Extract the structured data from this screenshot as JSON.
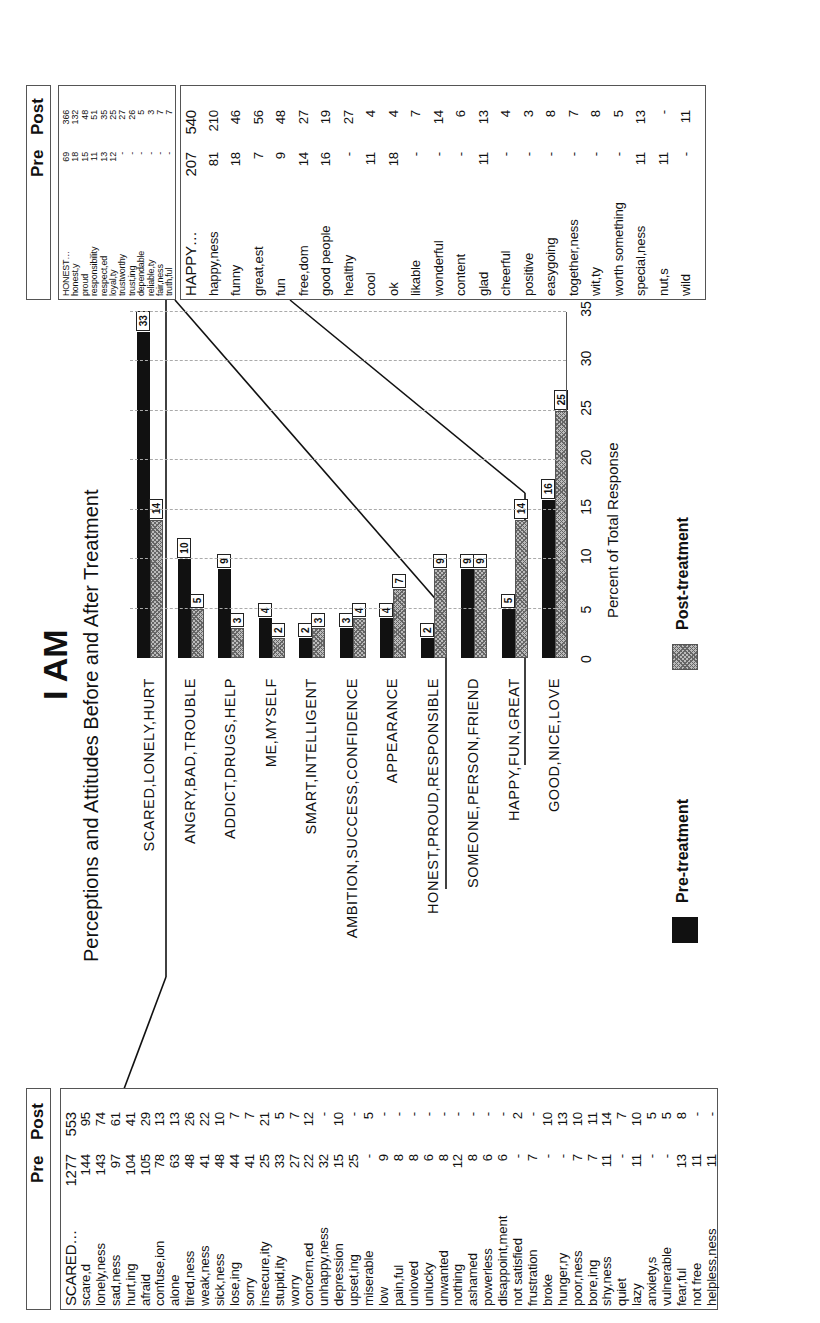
{
  "title": "I AM",
  "subtitle": "Perceptions and Attitudes Before and After Treatment",
  "chart_data": {
    "type": "bar",
    "orientation": "vertical bars on rotated page",
    "title": "I AM",
    "subtitle": "Perceptions and Attitudes Before and After Treatment",
    "xlabel": "",
    "ylabel": "Percent of Total Response",
    "ylim": [
      0,
      35
    ],
    "yticks": [
      0,
      5,
      10,
      15,
      20,
      25,
      30,
      35
    ],
    "grid": true,
    "legend_position": "bottom",
    "categories": [
      "SCARED,LONELY,HURT",
      "ANGRY,BAD,TROUBLE",
      "ADDICT,DRUGS,HELP",
      "ME,MYSELF",
      "SMART,INTELLIGENT",
      "AMBITION,SUCCESS,CONFIDENCE",
      "APPEARANCE",
      "HONEST,PROUD,RESPONSIBLE",
      "SOMEONE,PERSON,FRIEND",
      "HAPPY,FUN,GREAT",
      "GOOD,NICE,LOVE"
    ],
    "series": [
      {
        "name": "Pre-treatment",
        "color": "#111111",
        "values": [
          33,
          10,
          9,
          4,
          2,
          3,
          4,
          2,
          9,
          5,
          16
        ]
      },
      {
        "name": "Post-treatment",
        "color": "#b0b0b0",
        "pattern": "crosshatch",
        "values": [
          14,
          5,
          3,
          2,
          3,
          4,
          7,
          9,
          9,
          14,
          25
        ]
      }
    ]
  },
  "axis": {
    "title": "Percent of Total Response",
    "ticks": [
      "0",
      "5",
      "10",
      "15",
      "20",
      "25",
      "30",
      "35"
    ]
  },
  "legend": {
    "pre": "Pre-treatment",
    "post": "Post-treatment"
  },
  "tables": {
    "scared": {
      "header_pre": "Pre",
      "header_post": "Post",
      "rows": [
        {
          "word": "SCARED…",
          "pre": "1277",
          "post": "553"
        },
        {
          "word": "scare,d",
          "pre": "144",
          "post": "95"
        },
        {
          "word": "lonely,ness",
          "pre": "143",
          "post": "74"
        },
        {
          "word": "sad,ness",
          "pre": "97",
          "post": "61"
        },
        {
          "word": "hurt,ing",
          "pre": "104",
          "post": "41"
        },
        {
          "word": "afraid",
          "pre": "105",
          "post": "29"
        },
        {
          "word": "confuse,ion",
          "pre": "78",
          "post": "13"
        },
        {
          "word": "alone",
          "pre": "63",
          "post": "13"
        },
        {
          "word": "tired,ness",
          "pre": "48",
          "post": "26"
        },
        {
          "word": "weak,ness",
          "pre": "41",
          "post": "22"
        },
        {
          "word": "sick,ness",
          "pre": "48",
          "post": "10"
        },
        {
          "word": "lose,ing",
          "pre": "44",
          "post": "7"
        },
        {
          "word": "sorry",
          "pre": "41",
          "post": "7"
        },
        {
          "word": "insecure,ity",
          "pre": "25",
          "post": "21"
        },
        {
          "word": "stupid,ity",
          "pre": "33",
          "post": "5"
        },
        {
          "word": "worry",
          "pre": "27",
          "post": "7"
        },
        {
          "word": "concern,ed",
          "pre": "22",
          "post": "12"
        },
        {
          "word": "unhappy,ness",
          "pre": "32",
          "post": "-"
        },
        {
          "word": "depression",
          "pre": "15",
          "post": "10"
        },
        {
          "word": "upset,ing",
          "pre": "25",
          "post": "-"
        },
        {
          "word": "miserable",
          "pre": "-",
          "post": "5"
        },
        {
          "word": "low",
          "pre": "9",
          "post": "-"
        },
        {
          "word": "pain,ful",
          "pre": "8",
          "post": "-"
        },
        {
          "word": "unloved",
          "pre": "8",
          "post": "-"
        },
        {
          "word": "unlucky",
          "pre": "6",
          "post": "-"
        },
        {
          "word": "unwanted",
          "pre": "8",
          "post": "-"
        },
        {
          "word": "nothing",
          "pre": "12",
          "post": "-"
        },
        {
          "word": "ashamed",
          "pre": "8",
          "post": "-"
        },
        {
          "word": "powerless",
          "pre": "6",
          "post": "-"
        },
        {
          "word": "disappoint,ment",
          "pre": "6",
          "post": "-"
        },
        {
          "word": "not satisfied",
          "pre": "-",
          "post": "2"
        },
        {
          "word": "frustration",
          "pre": "7",
          "post": "-"
        },
        {
          "word": "broke",
          "pre": "-",
          "post": "10"
        },
        {
          "word": "hunger,ry",
          "pre": "-",
          "post": "13"
        },
        {
          "word": "poor,ness",
          "pre": "7",
          "post": "10"
        },
        {
          "word": "bore,ing",
          "pre": "7",
          "post": "11"
        },
        {
          "word": "shy,ness",
          "pre": "11",
          "post": "14"
        },
        {
          "word": "quiet",
          "pre": "-",
          "post": "7"
        },
        {
          "word": "lazy",
          "pre": "11",
          "post": "10"
        },
        {
          "word": "anxiety,s",
          "pre": "-",
          "post": "5"
        },
        {
          "word": "vulnerable",
          "pre": "-",
          "post": "5"
        },
        {
          "word": "fear,ful",
          "pre": "13",
          "post": "8"
        },
        {
          "word": "not free",
          "pre": "11",
          "post": "-"
        },
        {
          "word": "helpless,ness",
          "pre": "11",
          "post": "-"
        }
      ]
    },
    "honest": {
      "header_pre": "Pre",
      "header_post": "Post",
      "rows": [
        {
          "word": "HONEST…",
          "pre": "69",
          "post": "366"
        },
        {
          "word": "honest,y",
          "pre": "18",
          "post": "132"
        },
        {
          "word": "proud",
          "pre": "15",
          "post": "48"
        },
        {
          "word": "responsibility",
          "pre": "11",
          "post": "51"
        },
        {
          "word": "respect,ed",
          "pre": "13",
          "post": "35"
        },
        {
          "word": "loyal,ty",
          "pre": "12",
          "post": "25"
        },
        {
          "word": "trustworthy",
          "pre": "-",
          "post": "27"
        },
        {
          "word": "trust,ing",
          "pre": "-",
          "post": "26"
        },
        {
          "word": "dependable",
          "pre": "-",
          "post": "5"
        },
        {
          "word": "reliable,ty",
          "pre": "-",
          "post": "3"
        },
        {
          "word": "fair,ness",
          "pre": "-",
          "post": "7"
        },
        {
          "word": "truth,ful",
          "pre": "-",
          "post": "7"
        }
      ]
    },
    "happy": {
      "rows": [
        {
          "word": "HAPPY…",
          "pre": "207",
          "post": "540"
        },
        {
          "word": "happy,ness",
          "pre": "81",
          "post": "210"
        },
        {
          "word": "funny",
          "pre": "18",
          "post": "46"
        },
        {
          "word": "great,est",
          "pre": "7",
          "post": "56"
        },
        {
          "word": "fun",
          "pre": "9",
          "post": "48"
        },
        {
          "word": "free,dom",
          "pre": "14",
          "post": "27"
        },
        {
          "word": "good people",
          "pre": "16",
          "post": "19"
        },
        {
          "word": "healthy",
          "pre": "-",
          "post": "27"
        },
        {
          "word": "cool",
          "pre": "11",
          "post": "4"
        },
        {
          "word": "ok",
          "pre": "18",
          "post": "4"
        },
        {
          "word": "likable",
          "pre": "-",
          "post": "7"
        },
        {
          "word": "wonderful",
          "pre": "-",
          "post": "14"
        },
        {
          "word": "content",
          "pre": "-",
          "post": "6"
        },
        {
          "word": "glad",
          "pre": "11",
          "post": "13"
        },
        {
          "word": "cheerful",
          "pre": "-",
          "post": "4"
        },
        {
          "word": "positive",
          "pre": "-",
          "post": "3"
        },
        {
          "word": "easygoing",
          "pre": "-",
          "post": "8"
        },
        {
          "word": "together,ness",
          "pre": "-",
          "post": "7"
        },
        {
          "word": "wit,ty",
          "pre": "-",
          "post": "8"
        },
        {
          "word": "worth something",
          "pre": "-",
          "post": "5"
        },
        {
          "word": "special,ness",
          "pre": "11",
          "post": "13"
        },
        {
          "word": "nut,s",
          "pre": "11",
          "post": "-"
        },
        {
          "word": "wild",
          "pre": "-",
          "post": "11"
        }
      ]
    }
  }
}
